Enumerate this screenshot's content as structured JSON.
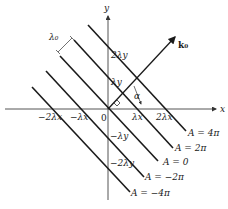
{
  "axes": {
    "x_label": "x",
    "y_label": "y",
    "origin_label": "0"
  },
  "x_ticks": [
    "−2λx",
    "−λx",
    "λx",
    "2λx"
  ],
  "y_ticks": [
    "2λy",
    "λy",
    "−λy",
    "−2λy"
  ],
  "wave_vector_label": "k₀",
  "angle_label": "α",
  "wavelength_label": "λ₀",
  "phase_lines": [
    {
      "label": "A = 4π"
    },
    {
      "label": "A = 2π"
    },
    {
      "label": "A = 0"
    },
    {
      "label": "A = −2π"
    },
    {
      "label": "A = −4π"
    }
  ],
  "colors": {
    "line": "#1a1a1a",
    "axis": "#555555",
    "background": "#ffffff"
  }
}
